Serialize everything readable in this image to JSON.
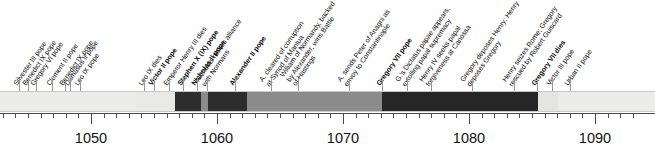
{
  "chart_data": {
    "type": "timeline",
    "title": "",
    "xlabel": "",
    "ylabel": "",
    "xlim": [
      1041,
      1093
    ],
    "grid": false,
    "legend": "none",
    "axis": {
      "major_ticks": [
        1050,
        1060,
        1070,
        1080,
        1090
      ],
      "major_tick_labels": [
        "1050",
        "1060",
        "1070",
        "1080",
        "1090"
      ],
      "minor_tick_interval": 1,
      "minor_tick_range": [
        1042,
        1093
      ]
    },
    "segments": [
      {
        "name": "early-popes-period",
        "start": 1041,
        "end": 1053.6,
        "color": "#ececeb",
        "shade": "light"
      },
      {
        "name": "leo-ix-late-period",
        "start": 1053.6,
        "end": 1056.7,
        "color": "#e9e9e8",
        "shade": "light"
      },
      {
        "name": "victor-ii-reign",
        "start": 1056.7,
        "end": 1058.7,
        "color": "#2d2d2d",
        "shade": "dark"
      },
      {
        "name": "stephen-x-interval",
        "start": 1058.7,
        "end": 1059.3,
        "color": "#8b8b8b",
        "shade": "medium"
      },
      {
        "name": "nicholas-ii-reign",
        "start": 1059.3,
        "end": 1062.4,
        "color": "#2d2d2d",
        "shade": "dark"
      },
      {
        "name": "alexander-ii-reign",
        "start": 1062.4,
        "end": 1073.1,
        "color": "#8b8b8b",
        "shade": "medium"
      },
      {
        "name": "gregory-vii-reign",
        "start": 1073.1,
        "end": 1085.5,
        "color": "#262626",
        "shade": "dark"
      },
      {
        "name": "victor-iii-reign",
        "start": 1085.5,
        "end": 1087.1,
        "color": "#e4e4e3",
        "shade": "light"
      },
      {
        "name": "urban-ii-reign",
        "start": 1087.1,
        "end": 1093,
        "color": "#ececeb",
        "shade": "light"
      }
    ],
    "events": [
      {
        "year": 1044.3,
        "label": "Silvester III pope",
        "bold": false,
        "lines": [
          "Silvester III pope"
        ]
      },
      {
        "year": 1045.0,
        "label": "Benedict IX pope",
        "bold": false,
        "lines": [
          "Benedict IX pope"
        ]
      },
      {
        "year": 1045.6,
        "label": "Gregory VI pope",
        "bold": false,
        "lines": [
          "Gregory VI pope"
        ]
      },
      {
        "year": 1046.9,
        "label": "Clement II pope",
        "bold": false,
        "lines": [
          "Clement II pope"
        ]
      },
      {
        "year": 1047.9,
        "label": "Benedict IX pope",
        "bold": false,
        "lines": [
          "Benedict IX pope"
        ]
      },
      {
        "year": 1048.3,
        "label": "Damasus II pope",
        "bold": false,
        "lines": [
          "Damasus II pope"
        ]
      },
      {
        "year": 1049.1,
        "label": "Leo IX pope",
        "bold": false,
        "lines": [
          "Leo IX pope"
        ]
      },
      {
        "year": 1054.2,
        "label": "Leo IX dies",
        "bold": false,
        "lines": [
          "Leo IX dies"
        ]
      },
      {
        "year": 1055.0,
        "label": "Victor II pope",
        "bold": true,
        "lines": [
          "Victor II pope"
        ]
      },
      {
        "year": 1056.2,
        "label": "Emperor Henry III dies",
        "bold": false,
        "lines": [
          "Emperor Henry III dies"
        ]
      },
      {
        "year": 1057.3,
        "label": "Stephen X (IX) pope",
        "bold": true,
        "lines": [
          "Stephen X (IX) pope"
        ]
      },
      {
        "year": 1058.4,
        "label": "Nicholas II pope",
        "bold": true,
        "lines": [
          "Nicholas II pope"
        ]
      },
      {
        "year": 1059.2,
        "label": "Nicholas makes alliance with Normans",
        "bold": false,
        "lines": [
          "Nicholas makes alliance",
          "with Normans"
        ]
      },
      {
        "year": 1061.4,
        "label": "Alexander II pope",
        "bold": true,
        "lines": [
          "Alexander II pope"
        ]
      },
      {
        "year": 1064.3,
        "label": "A. cleared of corruption at Synod of Mantua",
        "bold": false,
        "lines": [
          "A. cleared of corruption",
          "at Synod of Mantua"
        ]
      },
      {
        "year": 1066.4,
        "label": "William of Normandy, backed by Alexander, wins Battle of Hastings",
        "bold": false,
        "lines": [
          "William of Normandy, backed",
          "by Alexander, wins Battle",
          "of Hastings"
        ]
      },
      {
        "year": 1070.5,
        "label": "A. sends Peter of Anagni as envoy to Constantinople",
        "bold": false,
        "lines": [
          "A. sends Peter of Anagni as",
          "envoy to Constantinople"
        ]
      },
      {
        "year": 1073.1,
        "label": "Gregory VII pope",
        "bold": true,
        "lines": [
          "Gregory VII pope"
        ]
      },
      {
        "year": 1075.1,
        "label": "G.'s Dictatus papae appears, extolling papal supremacy",
        "bold": false,
        "lines": [
          "G.'s Dictatus papae appears,",
          "extolling papal supremacy"
        ]
      },
      {
        "year": 1077.0,
        "label": "Henry IV seeks papal forgiveness at Canossa",
        "bold": false,
        "lines": [
          "Henry IV seeks papal",
          "forgiveness at Canossa"
        ]
      },
      {
        "year": 1080.2,
        "label": "Gregory deposes Henry; Henry deposes Gregory",
        "bold": false,
        "lines": [
          "Gregory deposes Henry; Henry",
          "deposes Gregory"
        ]
      },
      {
        "year": 1083.6,
        "label": "Henry seizes Rome; Gregory rescued by Robert Guiscard",
        "bold": false,
        "lines": [
          "Henry seizes Rome; Gregory",
          "rescued by Robert Guiscard"
        ]
      },
      {
        "year": 1085.4,
        "label": "Gregory VII dies",
        "bold": true,
        "lines": [
          "Gregory VII dies"
        ]
      },
      {
        "year": 1086.6,
        "label": "Victor III pope",
        "bold": false,
        "lines": [
          "Victor III pope"
        ]
      },
      {
        "year": 1088.0,
        "label": "Urban II pope",
        "bold": false,
        "lines": [
          "Urban II pope"
        ]
      }
    ]
  }
}
